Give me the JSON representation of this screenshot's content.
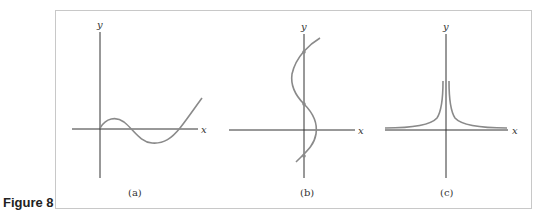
{
  "figure": {
    "label": "Figure 8",
    "panels": [
      {
        "id": "a",
        "caption": "(a)",
        "x_label": "x",
        "y_label": "y",
        "description": "cubic-like curve through origin, rising, dipping below axis, then rising"
      },
      {
        "id": "b",
        "caption": "(b)",
        "x_label": "x",
        "y_label": "y",
        "description": "S-shaped curve crossing the y-axis at three points (vertical line test fails)"
      },
      {
        "id": "c",
        "caption": "(c)",
        "x_label": "x",
        "y_label": "y",
        "description": "symmetric curve rising sharply toward the y-axis, approaching x-axis asymptotically"
      }
    ]
  },
  "colors": {
    "axis": "#333333",
    "curve": "#8a8a8a",
    "frame": "#c8c8c8"
  }
}
